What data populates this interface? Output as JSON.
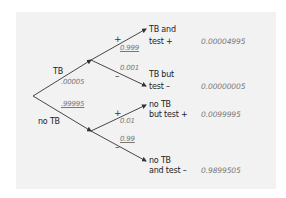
{
  "diagram": {
    "type": "probability-tree",
    "colors": {
      "line": "#333333",
      "label_text": "#222222",
      "probability_text": "#777777",
      "panel_background": "#f2f2f2"
    },
    "first_level": [
      {
        "label": "TB",
        "probability": ".00005"
      },
      {
        "label": "no TB",
        "probability": ".99995"
      }
    ],
    "second_level": [
      {
        "parent": "TB",
        "sign": "+",
        "probability": "0.999"
      },
      {
        "parent": "TB",
        "sign": "–",
        "probability": "0.001"
      },
      {
        "parent": "no TB",
        "sign": "+",
        "probability": "0.01"
      },
      {
        "parent": "no TB",
        "sign": "–",
        "probability": "0.99"
      }
    ],
    "outcomes": [
      {
        "line1": "TB and",
        "line2": "test +",
        "joint_probability": "0.00004995"
      },
      {
        "line1": "TB but",
        "line2": "test –",
        "joint_probability": "0.00000005"
      },
      {
        "line1": "no TB",
        "line2": "but test +",
        "joint_probability": "0.0099995"
      },
      {
        "line1": "no TB",
        "line2": "and test –",
        "joint_probability": "0.9899505"
      }
    ]
  }
}
